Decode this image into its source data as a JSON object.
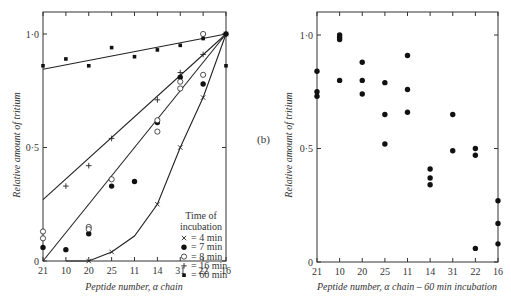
{
  "chart_data": [
    {
      "panel": "a",
      "type": "scatter",
      "title": "",
      "xlabel": "Peptide number, α chain",
      "ylabel": "Relative amount of tritium",
      "categories": [
        "21",
        "10",
        "20",
        "25",
        "11",
        "14",
        "31",
        "22",
        "16"
      ],
      "yticks": [
        "0",
        "0·5",
        "1·0"
      ],
      "ylim": [
        0,
        1.1
      ],
      "grid": false,
      "legend": {
        "title_line1": "Time of",
        "title_line2": "incubation",
        "position": "lower-right",
        "entries": [
          {
            "marker": "×",
            "label": "= 4 min"
          },
          {
            "marker": "●",
            "label": "= 7 min"
          },
          {
            "marker": "○",
            "label": "= 8 min"
          },
          {
            "marker": "+",
            "label": "= 16 min"
          },
          {
            "marker": "▪",
            "label": "= 60 min"
          }
        ]
      },
      "series": [
        {
          "name": "4 min",
          "marker": "x",
          "points": [
            [
              "20",
              0.0
            ],
            [
              "25",
              0.04
            ],
            [
              "14",
              0.25
            ],
            [
              "31",
              0.5
            ],
            [
              "22",
              0.72
            ],
            [
              "16",
              1.0
            ]
          ]
        },
        {
          "name": "7 min",
          "marker": "filled-circle",
          "points": [
            [
              "21",
              0.06
            ],
            [
              "10",
              0.05
            ],
            [
              "20",
              0.12
            ],
            [
              "25",
              0.33
            ],
            [
              "11",
              0.35
            ],
            [
              "14",
              0.61
            ],
            [
              "31",
              0.81
            ],
            [
              "22",
              0.78
            ],
            [
              "16",
              1.0
            ]
          ]
        },
        {
          "name": "8 min",
          "marker": "open-circle",
          "points": [
            [
              "21",
              0.13
            ],
            [
              "21",
              0.1
            ],
            [
              "20",
              0.15
            ],
            [
              "20",
              0.14
            ],
            [
              "25",
              0.36
            ],
            [
              "14",
              0.62
            ],
            [
              "14",
              0.57
            ],
            [
              "31",
              0.79
            ],
            [
              "31",
              0.76
            ],
            [
              "22",
              0.82
            ],
            [
              "22",
              1.0
            ]
          ]
        },
        {
          "name": "16 min",
          "marker": "plus",
          "points": [
            [
              "10",
              0.33
            ],
            [
              "20",
              0.42
            ],
            [
              "25",
              0.54
            ],
            [
              "14",
              0.71
            ],
            [
              "31",
              0.83
            ],
            [
              "22",
              0.91
            ],
            [
              "16",
              1.0
            ]
          ]
        },
        {
          "name": "60 min",
          "marker": "filled-square",
          "points": [
            [
              "21",
              0.86
            ],
            [
              "10",
              0.89
            ],
            [
              "20",
              0.86
            ],
            [
              "25",
              0.94
            ],
            [
              "11",
              0.9
            ],
            [
              "14",
              0.93
            ],
            [
              "31",
              0.95
            ],
            [
              "22",
              0.98
            ],
            [
              "16",
              1.0
            ],
            [
              "16",
              0.86
            ]
          ]
        }
      ],
      "fit_lines": [
        {
          "name": "60 min",
          "kind": "straight",
          "from": [
            "21",
            0.845
          ],
          "to": [
            "16",
            1.0
          ]
        },
        {
          "name": "16 min",
          "kind": "straight",
          "from": [
            "21",
            0.27
          ],
          "to": [
            "16",
            1.0
          ]
        },
        {
          "name": "7-8 min",
          "kind": "straight",
          "from": [
            "21",
            0.0
          ],
          "to": [
            "16",
            1.0
          ]
        },
        {
          "name": "4 min",
          "kind": "curve",
          "points": [
            [
              "10",
              0.0
            ],
            [
              "20",
              0.0
            ],
            [
              "25",
              0.04
            ],
            [
              "11",
              0.11
            ],
            [
              "14",
              0.25
            ],
            [
              "31",
              0.5
            ],
            [
              "22",
              0.72
            ],
            [
              "16",
              1.0
            ]
          ]
        }
      ]
    },
    {
      "panel": "b",
      "type": "scatter",
      "label": "(b)",
      "title": "",
      "xlabel": "Peptide number, α chain – 60 min incubation",
      "ylabel": "Relative amount of tritium",
      "categories": [
        "21",
        "10",
        "20",
        "25",
        "11",
        "14",
        "31",
        "22",
        "16"
      ],
      "yticks": [
        "0",
        "0·5",
        "1·0"
      ],
      "ylim": [
        0,
        1.1
      ],
      "grid": false,
      "series": [
        {
          "name": "60 min",
          "marker": "filled-circle",
          "points": [
            [
              "21",
              0.84
            ],
            [
              "21",
              0.75
            ],
            [
              "21",
              0.73
            ],
            [
              "10",
              1.0
            ],
            [
              "10",
              0.99
            ],
            [
              "10",
              0.98
            ],
            [
              "10",
              0.8
            ],
            [
              "20",
              0.88
            ],
            [
              "20",
              0.8
            ],
            [
              "20",
              0.74
            ],
            [
              "25",
              0.79
            ],
            [
              "25",
              0.65
            ],
            [
              "25",
              0.52
            ],
            [
              "11",
              0.91
            ],
            [
              "11",
              0.76
            ],
            [
              "11",
              0.66
            ],
            [
              "14",
              0.41
            ],
            [
              "14",
              0.37
            ],
            [
              "14",
              0.34
            ],
            [
              "31",
              0.65
            ],
            [
              "31",
              0.49
            ],
            [
              "22",
              0.5
            ],
            [
              "22",
              0.47
            ],
            [
              "22",
              0.06
            ],
            [
              "16",
              0.27
            ],
            [
              "16",
              0.17
            ],
            [
              "16",
              0.08
            ]
          ]
        }
      ]
    }
  ]
}
